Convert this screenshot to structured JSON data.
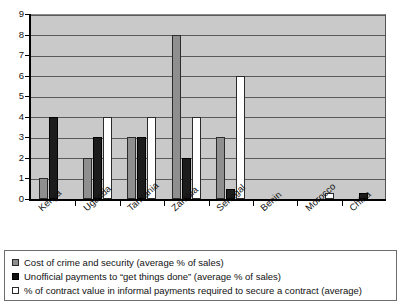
{
  "chart_data": {
    "type": "bar",
    "title": "",
    "xlabel": "",
    "ylabel": "",
    "ylim": [
      0,
      9
    ],
    "ytick_step": 1,
    "grid": true,
    "legend_position": "below",
    "orientation": "vertical",
    "grouping": "grouped",
    "categories": [
      "Kenya",
      "Uganda",
      "Tanzania",
      "Zambia",
      "Senegal",
      "Benin",
      "Morocco",
      "China"
    ],
    "yticks": [
      "0",
      "1",
      "2",
      "3",
      "4",
      "5",
      "6",
      "7",
      "8",
      "9"
    ],
    "series": [
      {
        "name": "Cost of crime and security (average % of sales)",
        "color": "#8f8f8f",
        "values": [
          1,
          2,
          3,
          8,
          3,
          0,
          0,
          0
        ]
      },
      {
        "name": "Unofficial payments to “get things done” (average % of sales)",
        "color": "#111111",
        "values": [
          4,
          3,
          3,
          2,
          0.5,
          0,
          0,
          0.3
        ]
      },
      {
        "name": "% of contract value in informal payments required to secure a contract (average)",
        "color": "#ffffff",
        "values": [
          0,
          4,
          4,
          4,
          6,
          0,
          0.3,
          0
        ]
      }
    ]
  },
  "legend": {
    "items": [
      {
        "swatch": "gray-swatch",
        "label": "Cost of crime and security (average % of sales)"
      },
      {
        "swatch": "black-swatch",
        "label": "Unofficial payments to “get things done” (average % of sales)"
      },
      {
        "swatch": "white-swatch",
        "label": "% of contract value in informal payments required to secure a contract (average)"
      }
    ]
  },
  "colors": {
    "panel_background": "#c9c9c9",
    "gridline": "#5a5a5a",
    "axis": "#000000",
    "series_gray": "#8f8f8f",
    "series_black": "#111111",
    "series_white": "#ffffff"
  }
}
